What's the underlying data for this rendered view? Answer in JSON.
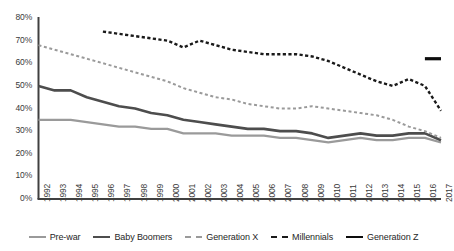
{
  "chart_data": {
    "type": "line",
    "title": "",
    "subtitle": "",
    "xlabel": "",
    "ylabel": "",
    "ylim": [
      0,
      0.8
    ],
    "ytick_labels": [
      "80%",
      "70%",
      "60%",
      "50%",
      "40%",
      "30%",
      "20%",
      "10%",
      "0%"
    ],
    "ytick_values": [
      80,
      70,
      60,
      50,
      40,
      30,
      20,
      10,
      0
    ],
    "grid": false,
    "legend_position": "bottom",
    "x": [
      1992,
      1993,
      1994,
      1995,
      1996,
      1997,
      1998,
      1999,
      2000,
      2001,
      2002,
      2003,
      2004,
      2005,
      2006,
      2007,
      2008,
      2009,
      2010,
      2011,
      2012,
      2013,
      2014,
      2015,
      2016,
      2017
    ],
    "xtick_labels": [
      "1992",
      "1993",
      "1994",
      "1995",
      "1996",
      "1997",
      "1998",
      "1999",
      "2000",
      "2001",
      "2002",
      "2003",
      "2004",
      "2005",
      "2006",
      "2007",
      "2008",
      "2009",
      "2010",
      "2011",
      "2012",
      "2013",
      "2014",
      "2015",
      "2016",
      "2017"
    ],
    "series": [
      {
        "name": "Pre-war",
        "color": "#9a9a9a",
        "style": "solid",
        "width": 2.2,
        "x": [
          1992,
          1993,
          1994,
          1995,
          1996,
          1997,
          1998,
          1999,
          2000,
          2001,
          2002,
          2003,
          2004,
          2005,
          2006,
          2007,
          2008,
          2009,
          2010,
          2011,
          2012,
          2013,
          2014,
          2015,
          2016,
          2017
        ],
        "values": [
          35,
          35,
          35,
          34,
          33,
          32,
          32,
          31,
          31,
          29,
          29,
          29,
          28,
          28,
          28,
          27,
          27,
          26,
          25,
          26,
          27,
          26,
          26,
          27,
          27,
          25
        ]
      },
      {
        "name": "Baby Boomers",
        "color": "#4d4d4d",
        "style": "solid",
        "width": 2.6,
        "x": [
          1992,
          1993,
          1994,
          1995,
          1996,
          1997,
          1998,
          1999,
          2000,
          2001,
          2002,
          2003,
          2004,
          2005,
          2006,
          2007,
          2008,
          2009,
          2010,
          2011,
          2012,
          2013,
          2014,
          2015,
          2016,
          2017
        ],
        "values": [
          50,
          48,
          48,
          45,
          43,
          41,
          40,
          38,
          37,
          35,
          34,
          33,
          32,
          31,
          31,
          30,
          30,
          29,
          27,
          28,
          29,
          28,
          28,
          29,
          29,
          26
        ]
      },
      {
        "name": "Generation X",
        "color": "#9a9a9a",
        "style": "dashed",
        "width": 2.0,
        "x": [
          1992,
          1993,
          1994,
          1995,
          1996,
          1997,
          1998,
          1999,
          2000,
          2001,
          2002,
          2003,
          2004,
          2005,
          2006,
          2007,
          2008,
          2009,
          2010,
          2011,
          2012,
          2013,
          2014,
          2015,
          2016,
          2017
        ],
        "values": [
          68,
          66,
          64,
          62,
          60,
          58,
          56,
          54,
          52,
          49,
          47,
          45,
          44,
          42,
          41,
          40,
          40,
          41,
          40,
          39,
          38,
          37,
          35,
          32,
          30,
          27
        ]
      },
      {
        "name": "Millennials",
        "color": "#1a1a1a",
        "style": "dashed",
        "width": 2.4,
        "x": [
          1996,
          1997,
          1998,
          1999,
          2000,
          2001,
          2002,
          2003,
          2004,
          2005,
          2006,
          2007,
          2008,
          2009,
          2010,
          2011,
          2012,
          2013,
          2014,
          2015,
          2016,
          2017
        ],
        "values": [
          74,
          73,
          72,
          71,
          70,
          67,
          70,
          68,
          66,
          65,
          64,
          64,
          64,
          63,
          61,
          58,
          55,
          52,
          50,
          53,
          50,
          39
        ]
      },
      {
        "name": "Generation Z",
        "color": "#0d0d0d",
        "style": "solid",
        "width": 3.2,
        "x": [
          2016,
          2017
        ],
        "values": [
          62,
          62
        ]
      }
    ]
  },
  "legend": {
    "items": [
      {
        "label": "Pre-war",
        "color": "#9a9a9a",
        "style": "solid"
      },
      {
        "label": "Baby Boomers",
        "color": "#4d4d4d",
        "style": "solid"
      },
      {
        "label": "Generation X",
        "color": "#9a9a9a",
        "style": "dashed"
      },
      {
        "label": "Millennials",
        "color": "#1a1a1a",
        "style": "dashed"
      },
      {
        "label": "Generation Z",
        "color": "#0d0d0d",
        "style": "solid"
      }
    ]
  },
  "axis": {
    "axis_color": "#404040"
  }
}
